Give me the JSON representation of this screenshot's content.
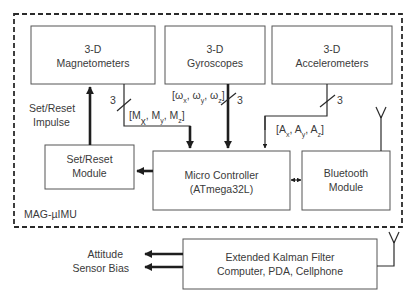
{
  "diagram": {
    "container_label": "MAG-µIMU",
    "blocks": {
      "magnetometers": {
        "line1": "3-D",
        "line2": "Magnetometers"
      },
      "gyroscopes": {
        "line1": "3-D",
        "line2": "Gyroscopes"
      },
      "accelerometers": {
        "line1": "3-D",
        "line2": "Accelerometers"
      },
      "set_reset": {
        "line1": "Set/Reset",
        "line2": "Module"
      },
      "micro_controller": {
        "line1": "Micro Controller",
        "line2": "(ATmega32L)"
      },
      "bluetooth": {
        "line1": "Bluetooth",
        "line2": "Module"
      },
      "kalman": {
        "line1": "Extended Kalman Filter",
        "line2": "Computer, PDA, Cellphone"
      }
    },
    "signals": {
      "set_reset_impulse": {
        "line1": "Set/Reset",
        "line2": "Impulse"
      },
      "mag_bus_width": "3",
      "mag_vector": {
        "open": "[M",
        "x": "x",
        "sep1": ", M",
        "y": "y",
        "sep2": ", M",
        "z": "z",
        "close": "]"
      },
      "gyro_bus_width": "3",
      "gyro_vector": {
        "open": "[ω",
        "x": "x",
        "sep1": ", ω",
        "y": "y",
        "sep2": ", ω",
        "z": "z",
        "close": "]"
      },
      "accel_bus_width": "3",
      "accel_vector": {
        "open": "[A",
        "x": "x",
        "sep1": ", A",
        "y": "y",
        "sep2": ", A",
        "z": "z",
        "close": "]"
      }
    },
    "outputs": {
      "attitude": "Attitude",
      "sensor_bias": "Sensor Bias"
    },
    "icons": {
      "bluetooth_antenna": "antenna-icon",
      "receiver_antenna": "antenna-icon"
    }
  }
}
